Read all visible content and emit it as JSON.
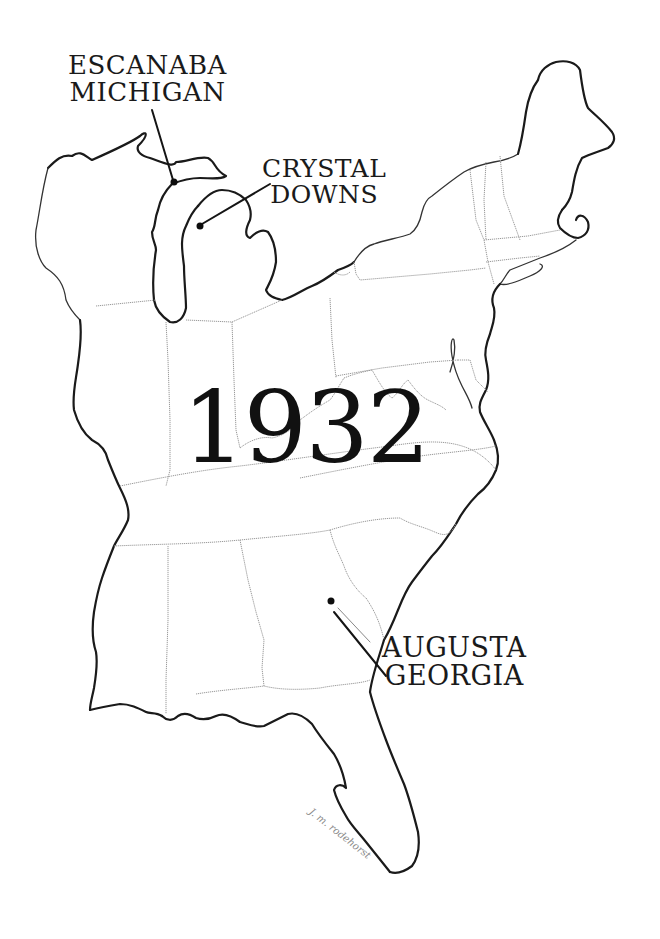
{
  "map": {
    "subject": "Eastern United States outline map",
    "year": "1932",
    "colors": {
      "background": "#ffffff",
      "ink": "#1a1a1a",
      "state_border": "#9a9a9a"
    },
    "locations": [
      {
        "name": "escanaba",
        "lines": [
          "ESCANABA",
          "MICHIGAN"
        ],
        "marker": "dot"
      },
      {
        "name": "crystal-downs",
        "lines": [
          "CRYSTAL",
          "DOWNS"
        ],
        "marker": "dot"
      },
      {
        "name": "augusta",
        "lines": [
          "AUGUSTA",
          "GEORGIA"
        ],
        "marker": "dot"
      }
    ],
    "signature": "J. m. rodehorst"
  }
}
